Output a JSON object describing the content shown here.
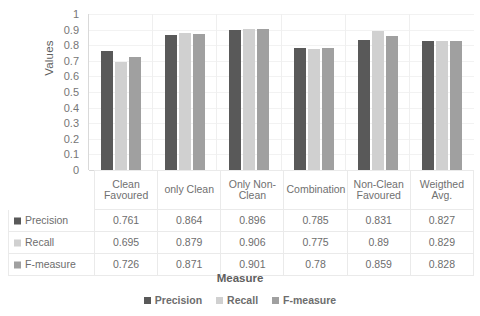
{
  "chart_data": {
    "type": "bar",
    "title": "",
    "xlabel": "Measure",
    "ylabel": "Values",
    "ylim": [
      0,
      1
    ],
    "ytick_labels": [
      "1",
      "0.9",
      "0.8",
      "0.7",
      "0.6",
      "0.5",
      "0.4",
      "0.3",
      "0.2",
      "0.1",
      "0"
    ],
    "ytick_values": [
      1,
      0.9,
      0.8,
      0.7,
      0.6,
      0.5,
      0.4,
      0.3,
      0.2,
      0.1,
      0
    ],
    "grid": true,
    "legend_position": "bottom",
    "categories": [
      "Clean Favoured",
      "only Clean",
      "Only Non-Clean",
      "Combination",
      "Non-Clean Favoured",
      "Weigthed Avg."
    ],
    "series": [
      {
        "name": "Precision",
        "color": "#595959",
        "values": [
          0.761,
          0.864,
          0.896,
          0.785,
          0.831,
          0.827
        ],
        "labels": [
          "0.761",
          "0.864",
          "0.896",
          "0.785",
          "0.831",
          "0.827"
        ]
      },
      {
        "name": "Recall",
        "color": "#d0d0d0",
        "values": [
          0.695,
          0.879,
          0.906,
          0.775,
          0.89,
          0.829
        ],
        "labels": [
          "0.695",
          "0.879",
          "0.906",
          "0.775",
          "0.89",
          "0.829"
        ]
      },
      {
        "name": "F-measure",
        "color": "#a0a0a0",
        "values": [
          0.726,
          0.871,
          0.901,
          0.78,
          0.859,
          0.828
        ],
        "labels": [
          "0.726",
          "0.871",
          "0.901",
          "0.78",
          "0.859",
          "0.828"
        ]
      }
    ]
  },
  "axis": {
    "y_title": "Values",
    "x_title": "Measure"
  },
  "legend": {
    "items": [
      {
        "label": "Precision",
        "color": "#595959"
      },
      {
        "label": "Recall",
        "color": "#d0d0d0"
      },
      {
        "label": "F-measure",
        "color": "#a0a0a0"
      }
    ]
  },
  "table": {
    "corner_label": "",
    "column_headers": [
      "Clean Favoured",
      "only Clean",
      "Only Non-Clean",
      "Combination",
      "Non-Clean Favoured",
      "Weigthed Avg."
    ],
    "rows": [
      {
        "header": "Precision",
        "color": "#595959",
        "cells": [
          "0.761",
          "0.864",
          "0.896",
          "0.785",
          "0.831",
          "0.827"
        ]
      },
      {
        "header": "Recall",
        "color": "#d0d0d0",
        "cells": [
          "0.695",
          "0.879",
          "0.906",
          "0.775",
          "0.89",
          "0.829"
        ]
      },
      {
        "header": "F-measure",
        "color": "#a0a0a0",
        "cells": [
          "0.726",
          "0.871",
          "0.901",
          "0.78",
          "0.859",
          "0.828"
        ]
      }
    ]
  },
  "colors": {
    "precision": "#595959",
    "recall": "#d0d0d0",
    "fmeasure": "#a0a0a0",
    "gridline": "#f2f2f2",
    "axis": "#d9d9d9",
    "text": "#6d6d6d"
  }
}
